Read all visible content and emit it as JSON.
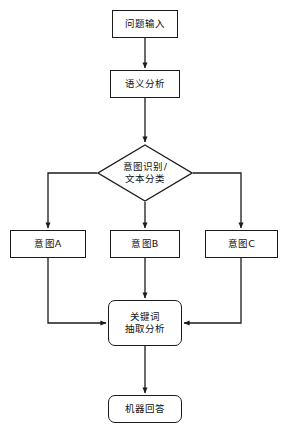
{
  "diagram": {
    "type": "flowchart",
    "orientation": "top-to-bottom",
    "background_color": "#ffffff",
    "stroke_color": "#1b1b1b",
    "text_color": "#111111",
    "nodes": [
      {
        "id": "question_input",
        "shape": "rectangle",
        "label": "问题输入"
      },
      {
        "id": "semantic_analysis",
        "shape": "rectangle",
        "label": "语义分析"
      },
      {
        "id": "intent_decision",
        "shape": "diamond",
        "label_line1": "意图识别/",
        "label_line2": "文本分类"
      },
      {
        "id": "intent_a",
        "shape": "rectangle",
        "label": "意图A"
      },
      {
        "id": "intent_b",
        "shape": "rectangle",
        "label": "意图B"
      },
      {
        "id": "intent_c",
        "shape": "rectangle",
        "label": "意图C"
      },
      {
        "id": "keyword_extraction",
        "shape": "rounded-rectangle",
        "label_line1": "关键词",
        "label_line2": "抽取分析"
      },
      {
        "id": "machine_answer",
        "shape": "rounded-rectangle",
        "label": "机器回答"
      }
    ],
    "edges": [
      {
        "from": "question_input",
        "to": "semantic_analysis",
        "label": "",
        "style": "straight-down"
      },
      {
        "from": "semantic_analysis",
        "to": "intent_decision",
        "label": "",
        "style": "straight-down"
      },
      {
        "from": "intent_decision",
        "to": "intent_a",
        "label": "",
        "style": "left-then-down"
      },
      {
        "from": "intent_decision",
        "to": "intent_b",
        "label": "",
        "style": "straight-down"
      },
      {
        "from": "intent_decision",
        "to": "intent_c",
        "label": "",
        "style": "right-then-down"
      },
      {
        "from": "intent_a",
        "to": "keyword_extraction",
        "label": "",
        "style": "down-then-right"
      },
      {
        "from": "intent_b",
        "to": "keyword_extraction",
        "label": "",
        "style": "straight-down"
      },
      {
        "from": "intent_c",
        "to": "keyword_extraction",
        "label": "",
        "style": "down-then-left"
      },
      {
        "from": "keyword_extraction",
        "to": "machine_answer",
        "label": "",
        "style": "straight-down"
      }
    ]
  }
}
